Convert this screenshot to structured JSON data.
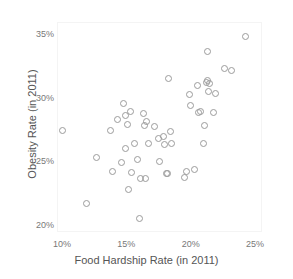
{
  "chart_data": {
    "type": "scatter",
    "title": "",
    "xlabel": "Food Hardship Rate (in 2011)",
    "ylabel": "Obesity Rate (in 2011)",
    "xlim": [
      8.8,
      25.6
    ],
    "ylim": [
      19.2,
      35.6
    ],
    "xticks": [
      10,
      15,
      20,
      25
    ],
    "xticklabels": [
      "10%",
      "15%",
      "20%",
      "25%"
    ],
    "yticks": [
      20,
      25,
      30,
      35
    ],
    "yticklabels": [
      "20%",
      "25%",
      "30%",
      "35%"
    ],
    "grid": false,
    "legend": null,
    "marker": "open-circle",
    "marker_color": "#9b9b9b",
    "n_points": 52,
    "series": [
      {
        "name": "States",
        "points": [
          [
            10.0,
            27.5
          ],
          [
            11.9,
            21.8
          ],
          [
            12.7,
            25.4
          ],
          [
            13.8,
            27.5
          ],
          [
            13.9,
            24.3
          ],
          [
            14.3,
            28.4
          ],
          [
            14.6,
            25.0
          ],
          [
            14.8,
            29.6
          ],
          [
            14.9,
            28.7
          ],
          [
            14.9,
            26.1
          ],
          [
            15.1,
            28.0
          ],
          [
            15.2,
            22.9
          ],
          [
            15.3,
            29.0
          ],
          [
            15.4,
            24.2
          ],
          [
            15.6,
            26.5
          ],
          [
            15.9,
            25.2
          ],
          [
            16.0,
            20.6
          ],
          [
            16.1,
            23.7
          ],
          [
            16.3,
            28.8
          ],
          [
            16.4,
            27.9
          ],
          [
            16.5,
            23.7
          ],
          [
            16.6,
            28.2
          ],
          [
            16.7,
            26.5
          ],
          [
            17.2,
            27.8
          ],
          [
            17.5,
            26.9
          ],
          [
            17.6,
            25.1
          ],
          [
            17.9,
            27.0
          ],
          [
            18.0,
            26.4
          ],
          [
            18.1,
            24.1
          ],
          [
            18.2,
            24.1
          ],
          [
            18.3,
            31.6
          ],
          [
            18.4,
            27.4
          ],
          [
            18.5,
            26.5
          ],
          [
            19.5,
            23.8
          ],
          [
            19.7,
            24.3
          ],
          [
            19.9,
            30.3
          ],
          [
            20.0,
            29.5
          ],
          [
            20.3,
            24.4
          ],
          [
            20.5,
            31.0
          ],
          [
            20.6,
            28.9
          ],
          [
            20.8,
            29.0
          ],
          [
            21.0,
            26.5
          ],
          [
            21.1,
            27.9
          ],
          [
            21.2,
            31.3
          ],
          [
            21.3,
            33.7
          ],
          [
            21.3,
            31.4
          ],
          [
            21.4,
            30.6
          ],
          [
            21.5,
            31.2
          ],
          [
            21.8,
            28.9
          ],
          [
            21.9,
            30.4
          ],
          [
            22.6,
            32.4
          ],
          [
            23.2,
            32.2
          ],
          [
            24.3,
            34.9
          ]
        ]
      }
    ]
  },
  "axes": {
    "x_title": "Food Hardship Rate (in 2011)",
    "y_title": "Obesity Rate (in 2011)"
  }
}
